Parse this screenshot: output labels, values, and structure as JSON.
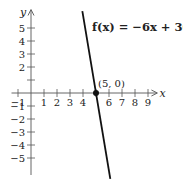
{
  "chart_data": {
    "type": "line",
    "title": "",
    "xlabel": "x",
    "ylabel": "y",
    "xlim": [
      -1.5,
      9.8
    ],
    "ylim": [
      -6,
      6.5
    ],
    "x_ticks": [
      -1,
      1,
      2,
      3,
      4,
      5,
      6,
      7,
      8,
      9
    ],
    "x_tick_labels": [
      "-1",
      "1",
      "2",
      "3",
      "4",
      "",
      "6",
      "7",
      "8",
      "9"
    ],
    "y_ticks": [
      -5,
      -4,
      -3,
      -2,
      -1,
      1,
      2,
      3,
      4,
      5
    ],
    "y_tick_labels": [
      "-5",
      "-4",
      "-3",
      "-2",
      "-1",
      "",
      "2",
      "3",
      "4",
      "5"
    ],
    "grid": false,
    "series": [
      {
        "name": "f(x) = −6x + 30",
        "equation": "f(x) = -6x + 30",
        "slope": -6,
        "intercept": 30,
        "x": [
          3.95,
          6.1
        ],
        "y": [
          6.3,
          -6.6
        ]
      }
    ],
    "annotations": [
      {
        "text": "f(x) = −6x + 30",
        "position": "upper right of line"
      },
      {
        "text": "(5, 0)",
        "point": [
          5,
          0
        ],
        "marker": "filled-circle"
      }
    ]
  },
  "labels": {
    "function": "f(x) = −6x + 30",
    "point": "(5, 0)",
    "x_axis": "x",
    "y_axis": "y"
  }
}
